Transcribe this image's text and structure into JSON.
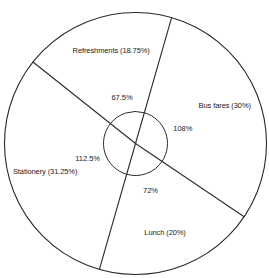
{
  "chart_data": {
    "type": "pie",
    "title": "",
    "start_angle_deg_from_top_clockwise": 16,
    "slices": [
      {
        "name": "Bus fares",
        "percent": 30,
        "angle_deg": 108,
        "label": "Bus fares (30%)",
        "angle_label": "108%"
      },
      {
        "name": "Lunch",
        "percent": 20,
        "angle_deg": 72,
        "label": "Lunch (20%)",
        "angle_label": "72%"
      },
      {
        "name": "Stationery",
        "percent": 31.25,
        "angle_deg": 112.5,
        "label": "Stationery (31.25%)",
        "angle_label": "112.5%"
      },
      {
        "name": "Refreshments",
        "percent": 18.75,
        "angle_deg": 67.5,
        "label": "Refreshments (18.75%)",
        "angle_label": "67.5%"
      }
    ],
    "colors": {
      "stroke": "#2a2a2a",
      "fill": "#ffffff",
      "text": "#222222"
    }
  }
}
